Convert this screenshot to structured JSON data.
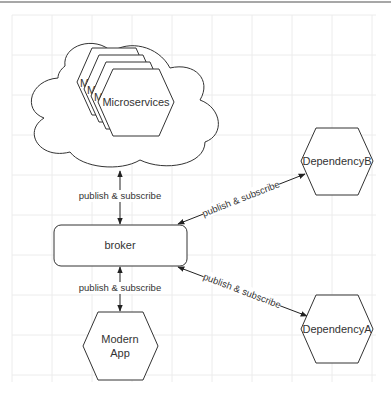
{
  "diagram": {
    "nodes": {
      "microservices_cloud": {
        "type": "cloud"
      },
      "microservices_stack": {
        "label": "Microservices",
        "stacked_labels": [
          "M",
          "M",
          "M"
        ],
        "type": "hexagon-stack"
      },
      "broker": {
        "label": "broker",
        "type": "rounded-rectangle"
      },
      "modern_app": {
        "label_lines": [
          "Modern",
          "App"
        ],
        "type": "hexagon"
      },
      "dependency_b": {
        "label": "DependencyB",
        "type": "hexagon"
      },
      "dependency_a": {
        "label": "DependencyA",
        "type": "hexagon"
      }
    },
    "edges": [
      {
        "from": "microservices_cloud",
        "to": "broker",
        "label": "publish & subscribe",
        "bidirectional": true
      },
      {
        "from": "broker",
        "to": "modern_app",
        "label": "publish & subscribe",
        "bidirectional": true
      },
      {
        "from": "broker",
        "to": "dependency_b",
        "label": "publish & subscribe",
        "bidirectional": true
      },
      {
        "from": "broker",
        "to": "dependency_a",
        "label": "publish & subscribe",
        "bidirectional": true
      }
    ]
  }
}
